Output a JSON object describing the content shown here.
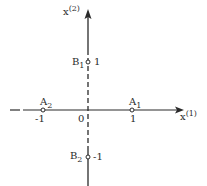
{
  "diagram": {
    "axes": {
      "x_label": "x",
      "x_label_sup": "(1)",
      "y_label": "x",
      "y_label_sup": "(2)",
      "origin_label": "0"
    },
    "points": [
      {
        "id": "A1",
        "name": "A",
        "sub": "1",
        "coord": "1",
        "x": 1,
        "y": 0
      },
      {
        "id": "A2",
        "name": "A",
        "sub": "2",
        "coord": "-1",
        "x": -1,
        "y": 0
      },
      {
        "id": "B1",
        "name": "B",
        "sub": "1",
        "coord": "1",
        "x": 0,
        "y": 1
      },
      {
        "id": "B2",
        "name": "B",
        "sub": "2",
        "coord": "-1",
        "x": 0,
        "y": -1
      }
    ],
    "colors": {
      "ink": "#2a2a2a",
      "background": "#ffffff"
    }
  }
}
